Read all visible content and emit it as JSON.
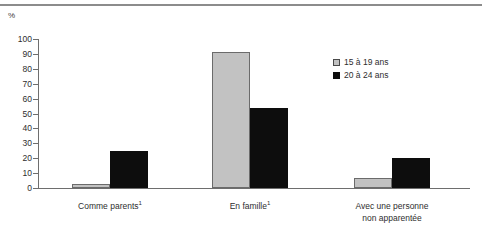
{
  "chart_data": {
    "type": "bar",
    "title": "",
    "xlabel": "",
    "ylabel": "%",
    "ylim": [
      0,
      100
    ],
    "ytick_step": 10,
    "grid": false,
    "legend_position": "right-inside",
    "yticks": [
      "100",
      "90",
      "80",
      "70",
      "60",
      "50",
      "40",
      "30",
      "20",
      "10",
      "0"
    ],
    "categories": [
      "Comme parents",
      "En famille",
      "Avec une personne non apparentée"
    ],
    "category_labels": [
      {
        "line1": "Comme parents",
        "sup": "1",
        "line2": ""
      },
      {
        "line1": "En famille",
        "sup": "1",
        "line2": ""
      },
      {
        "line1": "Avec une personne",
        "sup": "",
        "line2": "non apparentée"
      }
    ],
    "series": [
      {
        "name": "15 à 19 ans",
        "color": "#c2c2c2",
        "values": [
          3,
          91,
          7
        ]
      },
      {
        "name": "20 à 24 ans",
        "color": "#0d0d0d",
        "values": [
          25,
          54,
          20
        ]
      }
    ]
  },
  "legend": {
    "items": [
      {
        "label": "15 à 19 ans",
        "style": "light"
      },
      {
        "label": "20 à 24 ans",
        "style": "dark"
      }
    ]
  },
  "axis": {
    "unit_label": "%"
  }
}
